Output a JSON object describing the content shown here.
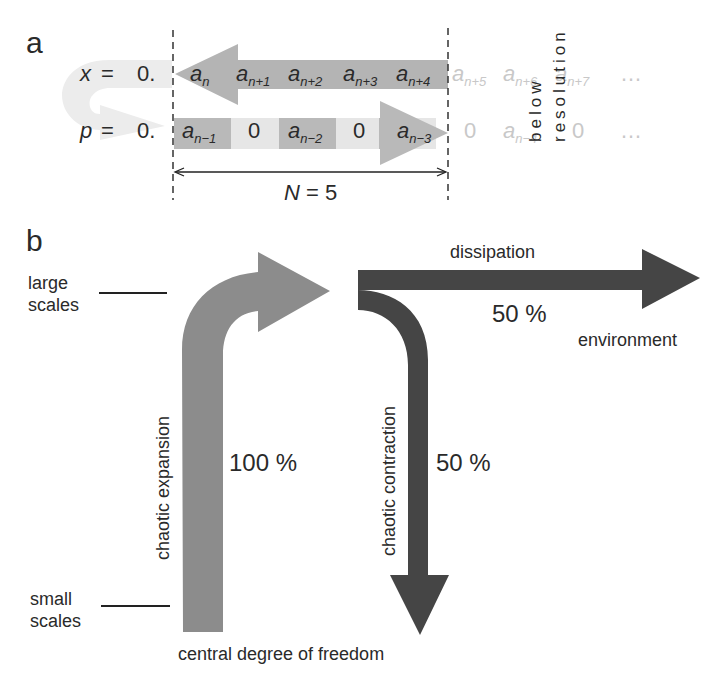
{
  "panel_a": {
    "letter": "a",
    "x_row": {
      "symbol": "x",
      "eq": "=",
      "lead": "0.",
      "cells": [
        {
          "base": "a",
          "sub": "n"
        },
        {
          "base": "a",
          "sub": "n+1"
        },
        {
          "base": "a",
          "sub": "n+2"
        },
        {
          "base": "a",
          "sub": "n+3"
        },
        {
          "base": "a",
          "sub": "n+4"
        }
      ],
      "faint_cells": [
        {
          "base": "a",
          "sub": "n+5"
        },
        {
          "base": "a",
          "sub": "n+6"
        },
        {
          "base": "a",
          "sub": "n+7"
        }
      ],
      "ellipsis": "…"
    },
    "p_row": {
      "symbol": "p",
      "eq": "=",
      "lead": "0.",
      "cells": [
        {
          "base": "a",
          "sub": "n−1"
        },
        {
          "base": "0",
          "sub": ""
        },
        {
          "base": "a",
          "sub": "n−2"
        },
        {
          "base": "0",
          "sub": ""
        },
        {
          "base": "a",
          "sub": "n−3"
        }
      ],
      "faint_cells": [
        {
          "base": "0",
          "sub": ""
        },
        {
          "base": "a",
          "sub": "n−4"
        },
        {
          "base": "0",
          "sub": ""
        }
      ],
      "ellipsis": "…"
    },
    "window_label": {
      "symbol": "N",
      "eq": "=",
      "value": "5"
    },
    "below_resolution": [
      "below",
      "resolution"
    ]
  },
  "panel_b": {
    "letter": "b",
    "large_scales": [
      "large",
      "scales"
    ],
    "small_scales": [
      "small",
      "scales"
    ],
    "expansion": {
      "label": "chaotic expansion",
      "percent": "100 %",
      "color": "#8c8c8c"
    },
    "dissipation": {
      "label": "dissipation",
      "percent": "50 %",
      "target": "environment",
      "color": "#454545"
    },
    "contraction": {
      "label": "chaotic contraction",
      "percent": "50 %",
      "color": "#454545"
    },
    "bottom_label": "central degree of freedom"
  },
  "colors": {
    "x_arrow": "#b4b4b4",
    "p_cell_dark": "#b9b9b9",
    "p_cell_light": "#e6e6e6",
    "uturn": "#ececec",
    "expansion": "#8c8c8c",
    "dark_arrows": "#454545"
  }
}
